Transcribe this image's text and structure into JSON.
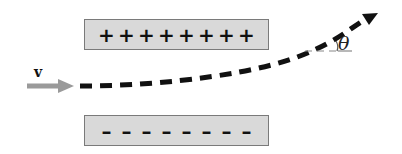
{
  "diagram": {
    "top_plate": {
      "sign": "positive",
      "charges": [
        "+",
        "+",
        "+",
        "+",
        "+",
        "+",
        "+",
        "+"
      ]
    },
    "bottom_plate": {
      "sign": "negative",
      "charges": [
        "–",
        "–",
        "–",
        "–",
        "–",
        "–",
        "–",
        "–"
      ]
    },
    "velocity_label": "v",
    "angle_label": "θ",
    "colors": {
      "plate_fill": "#d9d9d9",
      "plate_border": "#7a7a7a",
      "velocity_arrow": "#9a9a9a",
      "path": "#111111",
      "reference_line": "#888888"
    }
  }
}
